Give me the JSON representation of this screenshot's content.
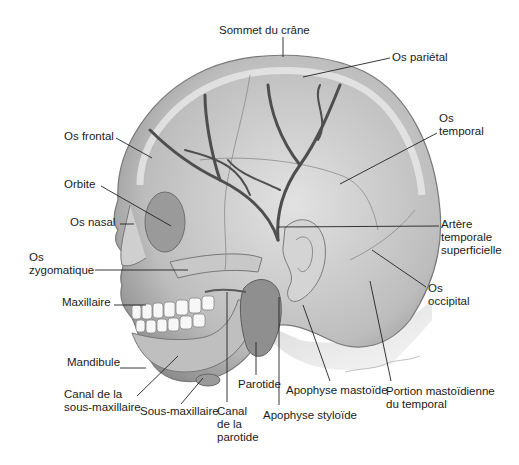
{
  "figure": {
    "colors": {
      "background": "#ffffff",
      "bone": "#d6d6d6",
      "bone_shadow": "#9e9e9e",
      "artery": "#5a5a5a",
      "label": "#1b1b1b",
      "leader": "#222222"
    }
  },
  "labels": [
    {
      "id": "sommet",
      "lines": [
        "Sommet du crâne"
      ],
      "x": 219,
      "y": 24,
      "tx": 283,
      "ty": 57,
      "lx": 283,
      "ly": 37
    },
    {
      "id": "parietal",
      "lines": [
        "Os pariétal"
      ],
      "x": 392,
      "y": 51,
      "tx": 303,
      "ty": 77,
      "lx": 390,
      "ly": 58
    },
    {
      "id": "temporal",
      "lines": [
        "Os",
        "temporal"
      ],
      "x": 439,
      "y": 112,
      "tx": 340,
      "ty": 184,
      "lx": 437,
      "ly": 133
    },
    {
      "id": "frontal",
      "lines": [
        "Os frontal"
      ],
      "x": 64,
      "y": 130,
      "tx": 152,
      "ty": 158,
      "lx": 116,
      "ly": 138
    },
    {
      "id": "orbite",
      "lines": [
        "Orbite"
      ],
      "x": 64,
      "y": 178,
      "tx": 171,
      "ty": 226,
      "lx": 101,
      "ly": 186
    },
    {
      "id": "nasal",
      "lines": [
        "Os nasal"
      ],
      "x": 70,
      "y": 216,
      "tx": 134,
      "ty": 224,
      "lx": 120,
      "ly": 224
    },
    {
      "id": "zygomatique",
      "lines": [
        "Os",
        "zygomatique"
      ],
      "x": 29,
      "y": 251,
      "tx": 188,
      "ty": 270,
      "lx": 95,
      "ly": 270
    },
    {
      "id": "arteretemp",
      "lines": [
        "Artère",
        "temporale",
        "superficielle"
      ],
      "x": 441,
      "y": 218,
      "tx": 278,
      "ty": 227,
      "lx": 439,
      "ly": 226
    },
    {
      "id": "occipital",
      "lines": [
        "Os",
        "occipital"
      ],
      "x": 428,
      "y": 282,
      "tx": 372,
      "ty": 250,
      "lx": 426,
      "ly": 287
    },
    {
      "id": "maxillaire",
      "lines": [
        "Maxillaire"
      ],
      "x": 62,
      "y": 296,
      "tx": 146,
      "ty": 305,
      "lx": 114,
      "ly": 305
    },
    {
      "id": "mandibule",
      "lines": [
        "Mandibule"
      ],
      "x": 67,
      "y": 356,
      "tx": 146,
      "ty": 368,
      "lx": 120,
      "ly": 368
    },
    {
      "id": "canalsous",
      "lines": [
        "Canal de la",
        "sous-maxillaire"
      ],
      "x": 64,
      "y": 388,
      "tx": 178,
      "ty": 356,
      "lx": 137,
      "ly": 396
    },
    {
      "id": "sousmax",
      "lines": [
        "Sous-maxillaire"
      ],
      "x": 140,
      "y": 405,
      "tx": 203,
      "ty": 378,
      "lx": 181,
      "ly": 404
    },
    {
      "id": "canalparo",
      "lines": [
        "Canal",
        "de la",
        "parotide"
      ],
      "x": 217,
      "y": 405,
      "tx": 227,
      "ty": 292,
      "lx": 227,
      "ly": 402
    },
    {
      "id": "parotide",
      "lines": [
        "Parotide"
      ],
      "x": 238,
      "y": 378,
      "tx": 256,
      "ty": 342,
      "lx": 256,
      "ly": 375
    },
    {
      "id": "styloide",
      "lines": [
        "Apophyse styloïde"
      ],
      "x": 263,
      "y": 409,
      "tx": 279,
      "ty": 297,
      "lx": 279,
      "ly": 405
    },
    {
      "id": "mastoide",
      "lines": [
        "Apophyse mastoïde"
      ],
      "x": 286,
      "y": 384,
      "tx": 303,
      "ty": 305,
      "lx": 330,
      "ly": 381
    },
    {
      "id": "portion",
      "lines": [
        "Portion mastoïdienne",
        "du temporal"
      ],
      "x": 386,
      "y": 385,
      "tx": 370,
      "ty": 281,
      "lx": 391,
      "ly": 381
    }
  ]
}
